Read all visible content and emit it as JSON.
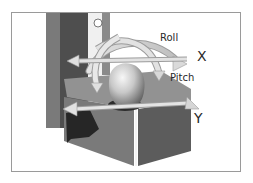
{
  "figure": {
    "labels": {
      "roll": "Roll",
      "pitch": "Pitch",
      "x_axis": "X",
      "y_axis": "Y"
    },
    "colors": {
      "frame_border": "#9a9a9a",
      "post_dark": "#5a5a5a",
      "post_mid": "#7d7d7d",
      "post_light": "#e6e6e6",
      "block_top": "#8e8e8e",
      "block_front": "#6f6f6f",
      "block_side": "#5e5e5e",
      "shadow": "#2e2e2e",
      "arrow_fill": "#dcdcdc",
      "arrow_edge": "#9c9c9c",
      "sphere_light": "#f2f2f2",
      "sphere_dark": "#6a6a6a"
    }
  }
}
